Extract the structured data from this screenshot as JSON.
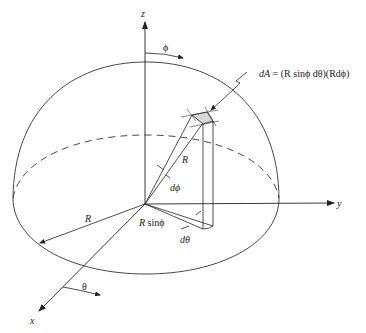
{
  "figure": {
    "axes": {
      "x": "x",
      "y": "y",
      "z": "z"
    },
    "angles": {
      "phi": "ϕ",
      "theta": "θ"
    },
    "labels": {
      "dA_formula_lhs": "dA",
      "dA_formula_rhs": " = (R sinϕ dθ)(Rdϕ)",
      "radius_upper": "R",
      "radius_left": "R",
      "r_sin_phi": "R sinϕ",
      "d_phi": "dϕ",
      "d_theta": "dθ"
    },
    "colors": {
      "line": "#333333",
      "patch_fill": "#d8d8d8",
      "background": "#ffffff"
    }
  }
}
